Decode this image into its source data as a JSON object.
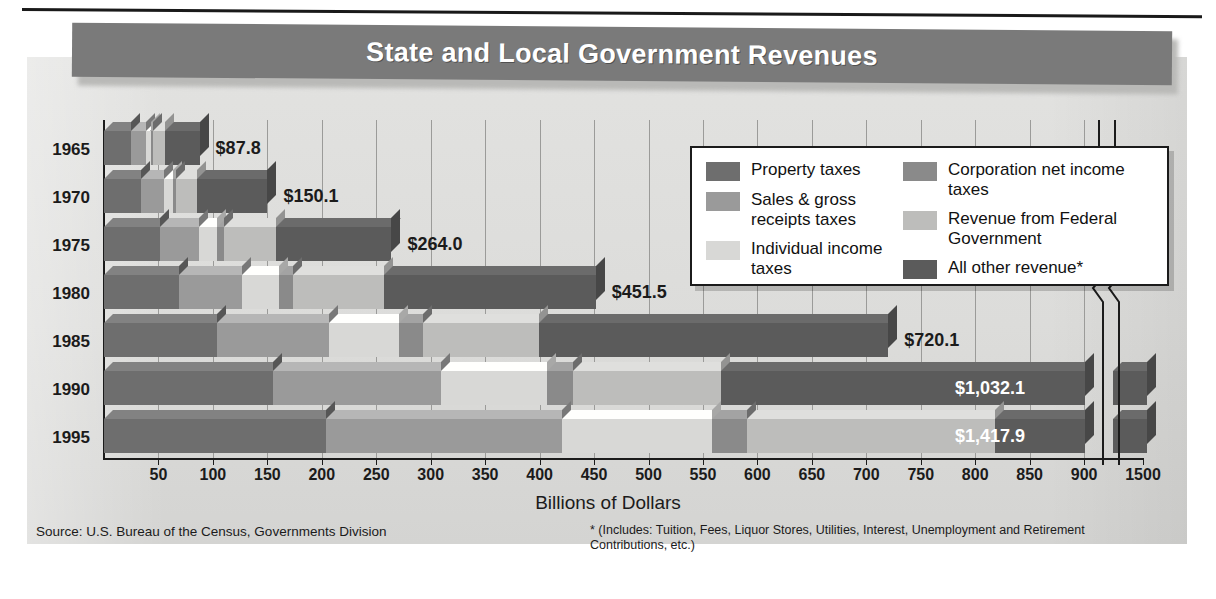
{
  "title": "State and Local Government Revenues",
  "axis_title": "Billions of Dollars",
  "source": "Source: U.S. Bureau of the Census, Governments Division",
  "footnote": "* (Includes: Tuition, Fees, Liquor Stores, Utilities, Interest, Unemployment and Retirement Contributions, etc.)",
  "legend": {
    "left": [
      {
        "label": "Property taxes",
        "color": "#6e6e6e"
      },
      {
        "label": "Sales & gross receipts taxes",
        "color": "#9a9a9a"
      },
      {
        "label": "Individual income taxes",
        "color": "#d8d8d6"
      }
    ],
    "right": [
      {
        "label": "Corporation net income taxes",
        "color": "#8a8a8a"
      },
      {
        "label": "Revenue from Federal Government",
        "color": "#bdbdbb"
      },
      {
        "label": "All other revenue*",
        "color": "#5b5b5b"
      }
    ]
  },
  "chart_data": {
    "type": "bar",
    "orientation": "horizontal",
    "stacked": true,
    "title": "State and Local Government Revenues",
    "xlabel": "Billions of Dollars",
    "ylabel": "",
    "grid": true,
    "legend_position": "inside-upper-right",
    "xlim": [
      0,
      950
    ],
    "axis_break": {
      "after": 925,
      "resume_label": "1500"
    },
    "xticks": [
      50,
      100,
      150,
      200,
      250,
      300,
      350,
      400,
      450,
      500,
      550,
      600,
      650,
      700,
      750,
      800,
      850,
      900,
      1500
    ],
    "categories": [
      "1965",
      "1970",
      "1975",
      "1980",
      "1985",
      "1990",
      "1995"
    ],
    "totals": [
      87.8,
      150.1,
      264.0,
      451.5,
      720.1,
      1032.1,
      1417.9
    ],
    "total_labels": [
      "$87.8",
      "$150.1",
      "$264.0",
      "$451.5",
      "$720.1",
      "$1,032.1",
      "$1,417.9"
    ],
    "series": [
      {
        "name": "Property taxes",
        "color": "#6e6e6e",
        "values": [
          24.7,
          34.1,
          51.5,
          68.5,
          103.8,
          155.6,
          203.5
        ]
      },
      {
        "name": "Sales & gross receipts taxes",
        "color": "#9a9a9a",
        "values": [
          14.2,
          21.0,
          36.0,
          58.0,
          102.5,
          154.0,
          217.0
        ]
      },
      {
        "name": "Individual income taxes",
        "color": "#d8d8d6",
        "values": [
          4.1,
          8.0,
          16.5,
          34.0,
          65.0,
          97.0,
          138.0
        ]
      },
      {
        "name": "Corporation net income taxes",
        "color": "#8a8a8a",
        "values": [
          1.8,
          3.3,
          6.6,
          13.3,
          22.0,
          24.0,
          32.0
        ]
      },
      {
        "name": "Revenue from Federal Government",
        "color": "#bdbdbb",
        "values": [
          11.0,
          19.2,
          47.0,
          83.0,
          106.0,
          136.0,
          228.0
        ]
      },
      {
        "name": "All other revenue*",
        "color": "#5b5b5b",
        "values": [
          32.0,
          64.5,
          106.4,
          194.7,
          320.8,
          465.5,
          599.4
        ]
      }
    ]
  }
}
